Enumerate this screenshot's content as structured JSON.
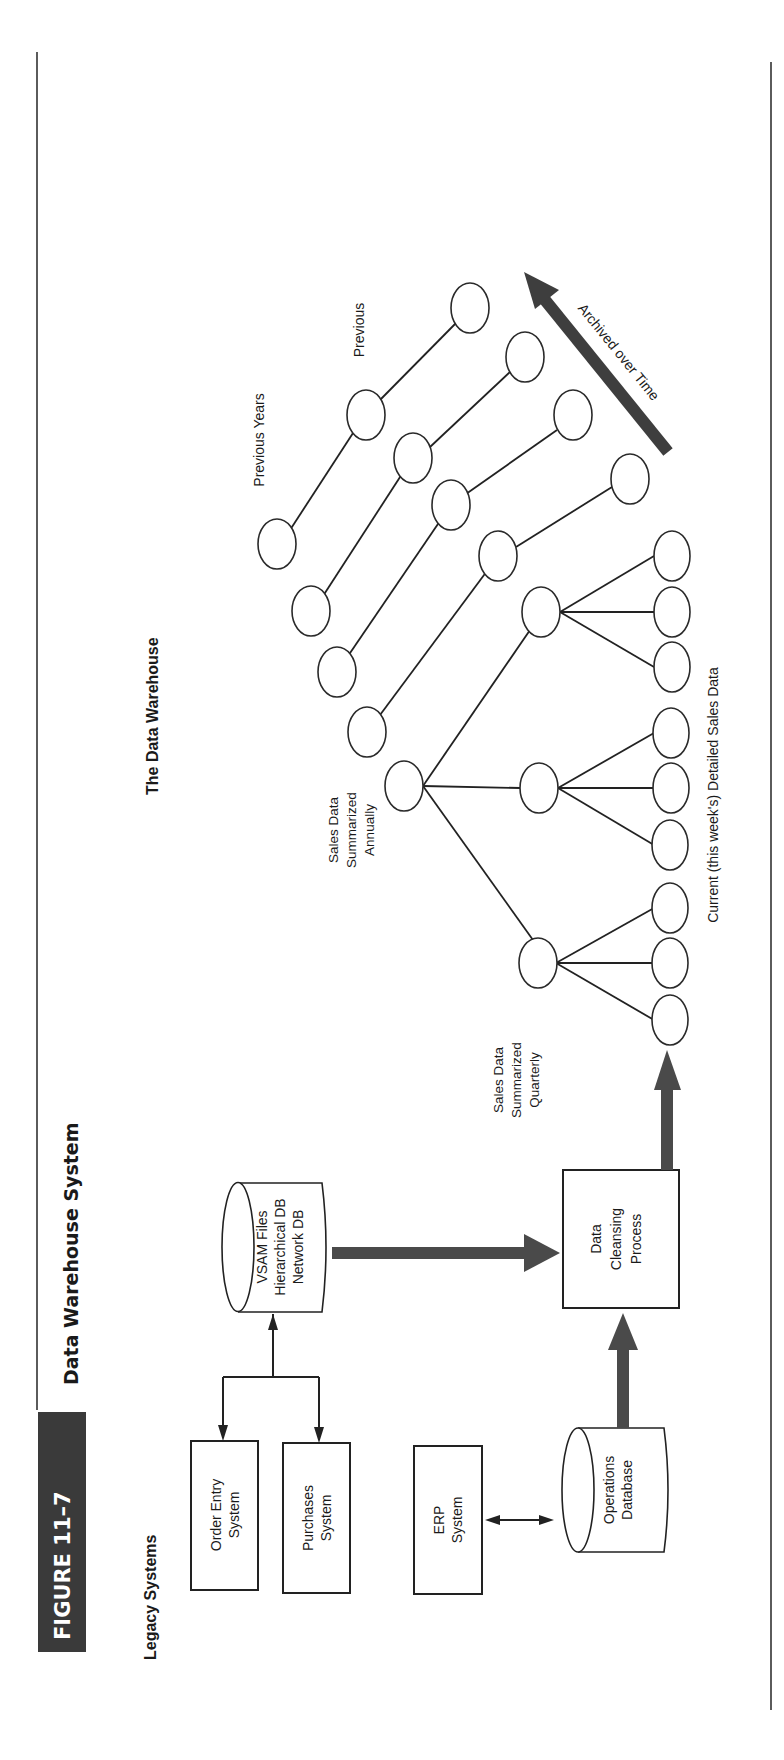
{
  "page": {
    "figure_label": "FIGURE 11–7",
    "figure_title": "Data Warehouse System",
    "colors": {
      "figure_label_bg": "#3a3a3a",
      "fat_arrow": "#4a4a4a",
      "line": "#222222",
      "background": "#ffffff"
    }
  },
  "legacy": {
    "heading": "Legacy Systems",
    "order_entry": [
      "Order Entry",
      "System"
    ],
    "purchases": [
      "Purchases",
      "System"
    ],
    "erp": [
      "ERP",
      "System"
    ],
    "vsam": [
      "VSAM Files",
      "Hierarchical DB",
      "Network DB"
    ],
    "operations_db": [
      "Operations",
      "Database"
    ]
  },
  "process": {
    "cleansing": [
      "Data",
      "Cleansing",
      "Process"
    ]
  },
  "warehouse": {
    "heading": "The Data Warehouse",
    "annual_label": [
      "Sales Data",
      "Summarized",
      "Annually"
    ],
    "quarterly_label": [
      "Sales Data",
      "Summarized",
      "Quarterly"
    ],
    "current_label": "Current (this week's) Detailed Sales Data",
    "previous_years_label": "Previous Years",
    "previous_label": "Previous",
    "archive_label": "Archived over Time"
  }
}
